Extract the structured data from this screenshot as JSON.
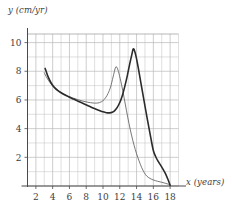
{
  "figure": {
    "name": "growth-rate-graph"
  },
  "axes": {
    "ylabel": "y (cm/yr)",
    "xlabel": "x (years)",
    "xticks": [
      2,
      4,
      6,
      8,
      10,
      12,
      14,
      16,
      18
    ],
    "yticks": [
      2,
      4,
      6,
      8,
      10
    ]
  },
  "chart_data": {
    "type": "line",
    "title": "",
    "xlabel": "x (years)",
    "ylabel": "y (cm/yr)",
    "xlim": [
      1,
      19
    ],
    "ylim": [
      0,
      10.6
    ],
    "xticks": [
      2,
      4,
      6,
      8,
      10,
      12,
      14,
      16,
      18
    ],
    "yticks": [
      2,
      4,
      6,
      8,
      10
    ],
    "grid": true,
    "grid_x_step": 1,
    "grid_y_step": 1,
    "legend": null,
    "series": [
      {
        "name": "thin-curve",
        "style": "thin",
        "color": "#555555",
        "width": 0.8,
        "points": [
          [
            3.0,
            7.9
          ],
          [
            3.3,
            7.55
          ],
          [
            3.7,
            7.2
          ],
          [
            4.1,
            6.92
          ],
          [
            4.6,
            6.68
          ],
          [
            5.2,
            6.46
          ],
          [
            5.8,
            6.28
          ],
          [
            6.4,
            6.14
          ],
          [
            7.0,
            6.02
          ],
          [
            7.6,
            5.92
          ],
          [
            8.2,
            5.84
          ],
          [
            8.8,
            5.79
          ],
          [
            9.2,
            5.78
          ],
          [
            9.6,
            5.82
          ],
          [
            10.0,
            5.95
          ],
          [
            10.3,
            6.15
          ],
          [
            10.6,
            6.45
          ],
          [
            10.9,
            6.9
          ],
          [
            11.2,
            7.6
          ],
          [
            11.5,
            8.28
          ],
          [
            11.7,
            8.22
          ],
          [
            11.9,
            7.85
          ],
          [
            12.2,
            7.1
          ],
          [
            12.5,
            6.2
          ],
          [
            12.8,
            5.25
          ],
          [
            13.1,
            4.35
          ],
          [
            13.4,
            3.55
          ],
          [
            13.7,
            2.85
          ],
          [
            14.0,
            2.25
          ],
          [
            14.3,
            1.75
          ],
          [
            14.6,
            1.3
          ],
          [
            14.9,
            0.95
          ],
          [
            15.2,
            0.7
          ],
          [
            15.6,
            0.53
          ],
          [
            16.0,
            0.42
          ],
          [
            16.5,
            0.33
          ],
          [
            17.0,
            0.26
          ],
          [
            17.5,
            0.18
          ],
          [
            18.0,
            0.08
          ]
        ]
      },
      {
        "name": "thick-curve",
        "style": "thick",
        "color": "#2b2b2b",
        "width": 1.6,
        "points": [
          [
            3.1,
            8.2
          ],
          [
            3.4,
            7.7
          ],
          [
            3.8,
            7.2
          ],
          [
            4.2,
            6.88
          ],
          [
            4.7,
            6.62
          ],
          [
            5.3,
            6.4
          ],
          [
            5.9,
            6.22
          ],
          [
            6.5,
            6.06
          ],
          [
            7.1,
            5.9
          ],
          [
            7.7,
            5.74
          ],
          [
            8.3,
            5.58
          ],
          [
            8.9,
            5.42
          ],
          [
            9.5,
            5.28
          ],
          [
            10.0,
            5.17
          ],
          [
            10.4,
            5.11
          ],
          [
            10.8,
            5.1
          ],
          [
            11.1,
            5.14
          ],
          [
            11.4,
            5.26
          ],
          [
            11.7,
            5.48
          ],
          [
            12.0,
            5.82
          ],
          [
            12.3,
            6.3
          ],
          [
            12.6,
            6.95
          ],
          [
            12.9,
            7.7
          ],
          [
            13.2,
            8.55
          ],
          [
            13.45,
            9.2
          ],
          [
            13.6,
            9.55
          ],
          [
            13.75,
            9.45
          ],
          [
            13.95,
            9.0
          ],
          [
            14.2,
            8.25
          ],
          [
            14.5,
            7.25
          ],
          [
            14.8,
            6.25
          ],
          [
            15.1,
            5.25
          ],
          [
            15.4,
            4.3
          ],
          [
            15.7,
            3.35
          ],
          [
            16.0,
            2.48
          ],
          [
            16.3,
            2.02
          ],
          [
            16.6,
            1.7
          ],
          [
            16.9,
            1.42
          ],
          [
            17.2,
            1.12
          ],
          [
            17.5,
            0.8
          ],
          [
            17.75,
            0.45
          ],
          [
            18.0,
            0.05
          ]
        ]
      }
    ]
  }
}
